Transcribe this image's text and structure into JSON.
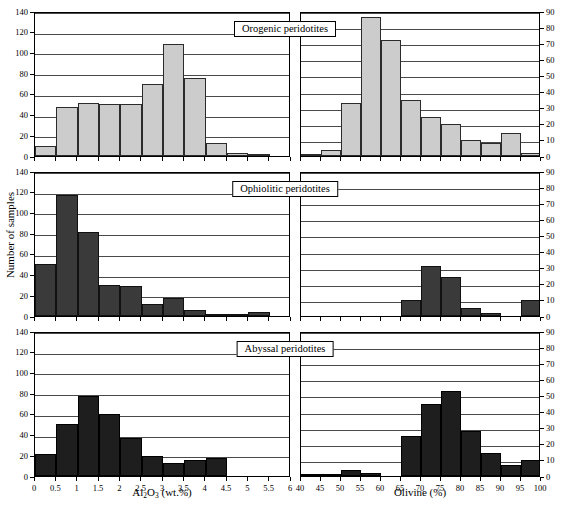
{
  "figure": {
    "y_axis_label": "Number of samples",
    "left_axis_title_html": "Al2O3 (wt.%)",
    "left_axis_title_main": "Al",
    "left_axis_title_sub1": "2",
    "left_axis_title_mid": "O",
    "left_axis_title_sub2": "3",
    "left_axis_title_tail": " (wt.%)",
    "right_axis_title": "Olivine (%)",
    "colors": {
      "orogenic_bar": "#cccccc",
      "ophiolitic_bar": "#3a3a3a",
      "abyssal_bar": "#1e1e1e",
      "axis": "#000000",
      "gridline": "#4a4a4a"
    }
  },
  "panels": [
    {
      "name": "orogenic",
      "title": "Orogenic peridotites",
      "fill": "light"
    },
    {
      "name": "ophiolitic",
      "title": "Ophiolitic peridotites",
      "fill": "dark"
    },
    {
      "name": "abyssal",
      "title": "Abyssal peridotites",
      "fill": "darker"
    }
  ],
  "chart_data": [
    {
      "type": "bar",
      "title": "Orogenic peridotites",
      "panel": "orogenic",
      "side": "left",
      "xlabel": "Al2O3 (wt.%)",
      "ylabel": "Number of samples",
      "xlim": [
        0,
        6
      ],
      "ylim": [
        0,
        140
      ],
      "ytick_labels": [
        "0",
        "20",
        "40",
        "60",
        "80",
        "100",
        "120",
        "140"
      ],
      "xtick_labels": [
        "0",
        "0.5",
        "1",
        "1.5",
        "2",
        "2.5",
        "3",
        "3.5",
        "4",
        "4.5",
        "5",
        "5.5",
        "6"
      ],
      "bin_width": 0.5,
      "bin_starts": [
        0,
        0.5,
        1,
        1.5,
        2,
        2.5,
        3,
        3.5,
        4,
        4.5,
        5,
        5.5
      ],
      "values": [
        10,
        47,
        51,
        50,
        50,
        70,
        108,
        75,
        13,
        3,
        1,
        0
      ],
      "grid": true
    },
    {
      "type": "bar",
      "title": "Orogenic peridotites",
      "panel": "orogenic",
      "side": "right",
      "xlabel": "Olivine (%)",
      "ylabel": "Number of samples",
      "xlim": [
        40,
        100
      ],
      "ylim": [
        0,
        90
      ],
      "ytick_labels": [
        "0",
        "10",
        "20",
        "30",
        "40",
        "50",
        "60",
        "70",
        "80",
        "90"
      ],
      "xtick_labels": [
        "40",
        "45",
        "50",
        "55",
        "60",
        "65",
        "70",
        "75",
        "80",
        "85",
        "90",
        "95",
        "100"
      ],
      "bin_width": 5,
      "bin_starts": [
        40,
        45,
        50,
        55,
        60,
        65,
        70,
        75,
        80,
        85,
        90,
        95
      ],
      "values": [
        1,
        4,
        33,
        86,
        72,
        35,
        24,
        20,
        10,
        8,
        14,
        2
      ],
      "grid": true
    },
    {
      "type": "bar",
      "title": "Ophiolitic peridotites",
      "panel": "ophiolitic",
      "side": "left",
      "xlabel": "Al2O3 (wt.%)",
      "ylabel": "Number of samples",
      "xlim": [
        0,
        6
      ],
      "ylim": [
        0,
        140
      ],
      "ytick_labels": [
        "0",
        "20",
        "40",
        "60",
        "80",
        "100",
        "120",
        "140"
      ],
      "xtick_labels": [
        "0",
        "0.5",
        "1",
        "1.5",
        "2",
        "2.5",
        "3",
        "3.5",
        "4",
        "4.5",
        "5",
        "5.5",
        "6"
      ],
      "bin_width": 0.5,
      "bin_starts": [
        0,
        0.5,
        1,
        1.5,
        2,
        2.5,
        3,
        3.5,
        4,
        4.5,
        5,
        5.5
      ],
      "values": [
        50,
        117,
        81,
        30,
        29,
        12,
        17,
        6,
        1,
        1,
        4,
        0
      ],
      "grid": true
    },
    {
      "type": "bar",
      "title": "Ophiolitic peridotites",
      "panel": "ophiolitic",
      "side": "right",
      "xlabel": "Olivine (%)",
      "ylabel": "Number of samples",
      "xlim": [
        40,
        100
      ],
      "ylim": [
        0,
        90
      ],
      "ytick_labels": [
        "0",
        "10",
        "20",
        "30",
        "40",
        "50",
        "60",
        "70",
        "80",
        "90"
      ],
      "xtick_labels": [
        "40",
        "45",
        "50",
        "55",
        "60",
        "65",
        "70",
        "75",
        "80",
        "85",
        "90",
        "95",
        "100"
      ],
      "bin_width": 5,
      "bin_starts": [
        40,
        45,
        50,
        55,
        60,
        65,
        70,
        75,
        80,
        85,
        90,
        95
      ],
      "values": [
        0,
        0,
        0,
        0,
        0,
        10,
        31,
        24,
        5,
        2,
        0,
        10
      ],
      "grid": true
    },
    {
      "type": "bar",
      "title": "Abyssal peridotites",
      "panel": "abyssal",
      "side": "left",
      "xlabel": "Al2O3 (wt.%)",
      "ylabel": "Number of samples",
      "xlim": [
        0,
        6
      ],
      "ylim": [
        0,
        140
      ],
      "ytick_labels": [
        "0",
        "20",
        "40",
        "60",
        "80",
        "100",
        "120",
        "140"
      ],
      "xtick_labels": [
        "0",
        "0.5",
        "1",
        "1.5",
        "2",
        "2.5",
        "3",
        "3.5",
        "4",
        "4.5",
        "5",
        "5.5",
        "6"
      ],
      "bin_width": 0.5,
      "bin_starts": [
        0,
        0.5,
        1,
        1.5,
        2,
        2.5,
        3,
        3.5,
        4,
        4.5,
        5,
        5.5
      ],
      "values": [
        21,
        50,
        77,
        60,
        37,
        19,
        13,
        15,
        17,
        0,
        0,
        0
      ],
      "grid": true
    },
    {
      "type": "bar",
      "title": "Abyssal peridotites",
      "panel": "abyssal",
      "side": "right",
      "xlabel": "Olivine (%)",
      "ylabel": "Number of samples",
      "xlim": [
        40,
        100
      ],
      "ylim": [
        0,
        90
      ],
      "ytick_labels": [
        "0",
        "10",
        "20",
        "30",
        "40",
        "50",
        "60",
        "70",
        "80",
        "90"
      ],
      "xtick_labels": [
        "40",
        "45",
        "50",
        "55",
        "60",
        "65",
        "70",
        "75",
        "80",
        "85",
        "90",
        "95",
        "100"
      ],
      "bin_width": 5,
      "bin_starts": [
        40,
        45,
        50,
        55,
        60,
        65,
        70,
        75,
        80,
        85,
        90,
        95
      ],
      "values": [
        1,
        1,
        4,
        2,
        0,
        25,
        45,
        53,
        28,
        14,
        7,
        10
      ],
      "grid": true
    }
  ]
}
